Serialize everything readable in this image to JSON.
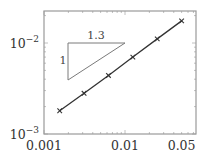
{
  "chart_data": {
    "type": "line",
    "title": "",
    "xlabel": "",
    "ylabel": "",
    "xscale": "log",
    "yscale": "log",
    "xlim": [
      0.001,
      0.06
    ],
    "ylim": [
      0.001,
      0.022
    ],
    "grid": false,
    "x_ticks": [
      {
        "value": 0.001,
        "label": "0.001"
      },
      {
        "value": 0.01,
        "label": "0.01"
      },
      {
        "value": 0.05,
        "label": "0.05"
      }
    ],
    "y_ticks": [
      {
        "value": 0.001,
        "base": "10",
        "exp": "−3"
      },
      {
        "value": 0.01,
        "base": "10",
        "exp": "−2"
      }
    ],
    "series": [
      {
        "name": "error",
        "marker": "x",
        "color": "#333333",
        "x": [
          0.0015625,
          0.003125,
          0.00625,
          0.0125,
          0.025,
          0.05
        ],
        "y": [
          0.0018,
          0.0028,
          0.0044,
          0.007,
          0.0111,
          0.0175
        ]
      }
    ],
    "annotations": {
      "slope_triangle": {
        "horizontal_label": "1.3",
        "vertical_label": "1",
        "color": "#666666"
      }
    }
  }
}
